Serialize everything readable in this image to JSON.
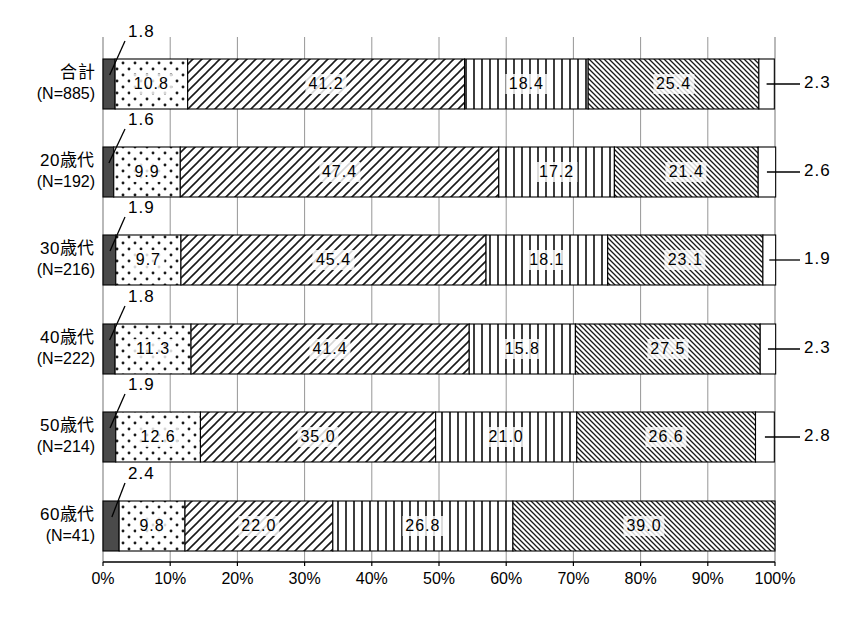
{
  "chart_data": {
    "type": "bar",
    "orientation": "horizontal",
    "stacked": true,
    "normalized_percent": true,
    "title": "",
    "subtitle": "",
    "xlabel": "",
    "ylabel": "",
    "xlim": [
      0,
      100
    ],
    "grid": true,
    "legend_position": "none",
    "axis_tick_labels": [
      "0%",
      "10%",
      "20%",
      "30%",
      "40%",
      "50%",
      "60%",
      "70%",
      "80%",
      "90%",
      "100%"
    ],
    "axis_tick_values": [
      0,
      10,
      20,
      30,
      40,
      50,
      60,
      70,
      80,
      90,
      100
    ],
    "categories": [
      {
        "label": "合計",
        "n_label": "(N=885)"
      },
      {
        "label": "20歳代",
        "n_label": "(N=192)"
      },
      {
        "label": "30歳代",
        "n_label": "(N=216)"
      },
      {
        "label": "40歳代",
        "n_label": "(N=222)"
      },
      {
        "label": "50歳代",
        "n_label": "(N=214)"
      },
      {
        "label": "60歳代",
        "n_label": "(N=41)"
      }
    ],
    "series": [
      {
        "name": "series-1",
        "pattern": "solid-dark-gray",
        "color": "#4a4a4a",
        "label_style": "callout-upper-left",
        "values": [
          1.8,
          1.6,
          1.9,
          1.8,
          1.9,
          2.4
        ],
        "value_labels": [
          "1.8",
          "1.6",
          "1.9",
          "1.8",
          "1.9",
          "2.4"
        ]
      },
      {
        "name": "series-2",
        "pattern": "dotted",
        "color": "#ffffff",
        "label_style": "inside",
        "values": [
          10.8,
          9.9,
          9.7,
          11.3,
          12.6,
          9.8
        ],
        "value_labels": [
          "10.8",
          "9.9",
          "9.7",
          "11.3",
          "12.6",
          "9.8"
        ]
      },
      {
        "name": "series-3",
        "pattern": "diagonal-backslash",
        "color": "#ffffff",
        "label_style": "inside",
        "values": [
          41.2,
          47.4,
          45.4,
          41.4,
          35.0,
          22.0
        ],
        "value_labels": [
          "41.2",
          "47.4",
          "45.4",
          "41.4",
          "35.0",
          "22.0"
        ]
      },
      {
        "name": "series-4",
        "pattern": "vertical-lines",
        "color": "#ffffff",
        "label_style": "inside",
        "values": [
          18.4,
          17.2,
          18.1,
          15.8,
          21.0,
          26.8
        ],
        "value_labels": [
          "18.4",
          "17.2",
          "18.1",
          "15.8",
          "21.0",
          "26.8"
        ]
      },
      {
        "name": "series-5",
        "pattern": "fine-diagonal-slash",
        "color": "#ffffff",
        "label_style": "inside",
        "values": [
          25.4,
          21.4,
          23.1,
          27.5,
          26.6,
          39.0
        ],
        "value_labels": [
          "25.4",
          "21.4",
          "23.1",
          "27.5",
          "26.6",
          "39.0"
        ]
      },
      {
        "name": "series-6",
        "pattern": "blank-white",
        "color": "#ffffff",
        "label_style": "callout-right",
        "values": [
          2.3,
          2.6,
          1.9,
          2.3,
          2.8,
          0.0
        ],
        "value_labels": [
          "2.3",
          "2.6",
          "1.9",
          "2.3",
          "2.8",
          ""
        ]
      }
    ]
  }
}
